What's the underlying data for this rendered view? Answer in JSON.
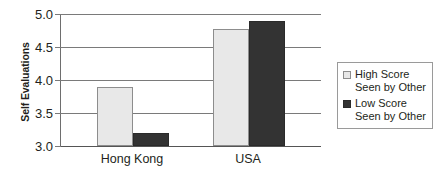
{
  "chart_data": {
    "type": "bar",
    "title": "",
    "xlabel": "",
    "ylabel": "Self Evaluations",
    "ylim": [
      3.0,
      5.0
    ],
    "ytick_labels": [
      "5.0",
      "4.5",
      "4.0",
      "3.5",
      "3.0"
    ],
    "ytick_values": [
      5.0,
      4.5,
      4.0,
      3.5,
      3.0
    ],
    "grid": true,
    "categories": [
      "Hong Kong",
      "USA"
    ],
    "series": [
      {
        "name": "High Score\nSeen by Other",
        "name_line1": "High Score",
        "name_line2": "Seen by Other",
        "color": "#e8e8e8",
        "values": [
          3.89,
          4.78
        ]
      },
      {
        "name": "Low Score\nSeen by Other",
        "name_line1": "Low Score",
        "name_line2": "Seen by Other",
        "color": "#333333",
        "values": [
          3.19,
          4.89
        ]
      }
    ],
    "legend_position": "right"
  },
  "axis": {
    "y_title": "Self Evaluations",
    "ticks": [
      {
        "label": "5.0"
      },
      {
        "label": "4.5"
      },
      {
        "label": "4.0"
      },
      {
        "label": "3.5"
      },
      {
        "label": "3.0"
      }
    ]
  },
  "categories": [
    {
      "label": "Hong Kong"
    },
    {
      "label": "USA"
    }
  ],
  "legend": {
    "entries": [
      {
        "line1": "High Score",
        "line2": "Seen by Other",
        "swatch": "light-swatch"
      },
      {
        "line1": "Low Score",
        "line2": "Seen by Other",
        "swatch": "dark-swatch"
      }
    ]
  }
}
